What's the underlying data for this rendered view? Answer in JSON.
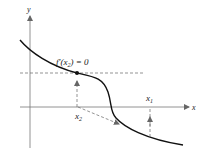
{
  "diagram": {
    "axes": {
      "x_label": "x",
      "y_label": "y"
    },
    "annotation": {
      "f_prefix": "f′(x",
      "f_sub": "2",
      "f_suffix": ") = 0"
    },
    "points": {
      "x1": {
        "base": "x",
        "sub": "1"
      },
      "x2": {
        "base": "x",
        "sub": "2"
      }
    },
    "colors": {
      "curve": "#111111",
      "axis": "#777777",
      "dashed": "#666666"
    }
  }
}
